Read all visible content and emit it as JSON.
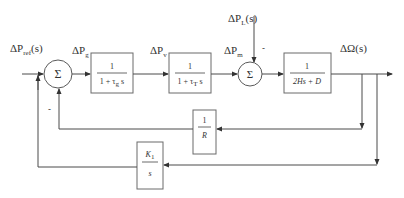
{
  "diagram": {
    "type": "block-diagram",
    "colors": {
      "line": "#4a4a4a",
      "block_border": "#6a6a6a",
      "text": "#333333",
      "background": "#ffffff"
    },
    "signals": {
      "reference": {
        "main": "ΔP",
        "sub": "ref",
        "suffix": "(s)"
      },
      "governor_out": {
        "main": "ΔP",
        "sub": "g"
      },
      "valve": {
        "main": "ΔP",
        "sub": "v"
      },
      "mechanical": {
        "main": "ΔP",
        "sub": "m"
      },
      "load": {
        "main": "ΔP",
        "sub": "L",
        "suffix": "(s)"
      },
      "output": {
        "main": "ΔΩ(s)"
      }
    },
    "summing_junctions": [
      {
        "id": "sum1",
        "symbol": "Σ",
        "feedback_sign": "-"
      },
      {
        "id": "sum2",
        "symbol": "Σ",
        "load_sign": "-"
      }
    ],
    "blocks": {
      "governor": {
        "num": "1",
        "den_prefix": "1 + τ",
        "den_sub": "g",
        "den_suffix": " s"
      },
      "turbine": {
        "num": "1",
        "den_prefix": "1 + τ",
        "den_sub": "T",
        "den_suffix": " s"
      },
      "inertia": {
        "num": "1",
        "den": "2Hs + D"
      },
      "droop": {
        "num": "1",
        "den": "R"
      },
      "integral": {
        "num_main": "K",
        "num_sub": "1",
        "den": "s"
      }
    }
  }
}
